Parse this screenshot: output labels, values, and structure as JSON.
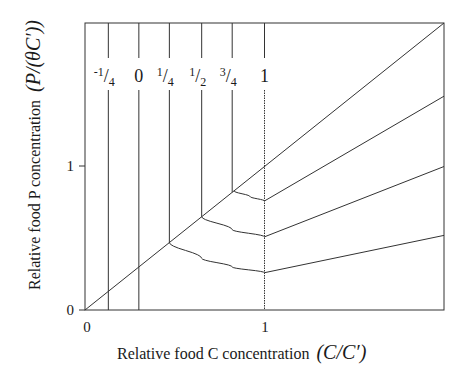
{
  "chart_data": {
    "type": "line",
    "title": "",
    "xlabel": "Relative food C concentration",
    "xlabel_math": "(C/C′)",
    "ylabel": "Relative food P concentration",
    "ylabel_math": "(P/(θC′))",
    "xlim": [
      0,
      2
    ],
    "ylim": [
      0,
      2
    ],
    "x_ticks": [
      {
        "value": 0,
        "label": "0"
      },
      {
        "value": 1,
        "label": "1"
      }
    ],
    "y_ticks": [
      {
        "value": 0,
        "label": "0"
      },
      {
        "value": 1,
        "label": "1"
      }
    ],
    "grid": false,
    "vertical_lines": [
      {
        "label": "-1/4",
        "label_num": "-1",
        "label_den": "4",
        "x": 0.13
      },
      {
        "label": "0",
        "label_num": "0",
        "label_den": "",
        "x": 0.3
      },
      {
        "label": "1/4",
        "label_num": "1",
        "label_den": "4",
        "x": 0.47
      },
      {
        "label": "1/2",
        "label_num": "1",
        "label_den": "2",
        "x": 0.65
      },
      {
        "label": "3/4",
        "label_num": "3",
        "label_den": "4",
        "x": 0.82
      },
      {
        "label": "1",
        "label_num": "1",
        "label_den": "",
        "x": 1.0
      }
    ],
    "series": [
      {
        "name": "diagonal P = C",
        "x": [
          0,
          2
        ],
        "y": [
          0,
          2
        ]
      },
      {
        "name": "isocline lower",
        "x": [
          0.47,
          0.65,
          0.82,
          1.0,
          2.0
        ],
        "y": [
          0.47,
          0.36,
          0.3,
          0.26,
          0.52
        ]
      },
      {
        "name": "isocline middle",
        "x": [
          0.65,
          0.82,
          1.0,
          2.0
        ],
        "y": [
          0.65,
          0.56,
          0.51,
          1.0
        ]
      },
      {
        "name": "isocline upper",
        "x": [
          0.83,
          0.92,
          1.0,
          2.0
        ],
        "y": [
          0.83,
          0.79,
          0.76,
          1.49
        ]
      }
    ]
  }
}
